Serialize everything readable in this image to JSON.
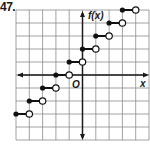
{
  "problem_number": "47.",
  "colors": {
    "grid": "#8c8c8c",
    "axis": "#1a1a1a",
    "step": "#111111",
    "open_fill": "#ffffff"
  },
  "chart_data": {
    "type": "line",
    "subtype": "step_function",
    "title": "",
    "xlabel": "x",
    "ylabel": "f(x)",
    "origin_label": "O",
    "xlim": [
      -5,
      5
    ],
    "ylim": [
      -5,
      5
    ],
    "grid": true,
    "grid_spacing": 1,
    "legend": null,
    "function": "f(x) = [[x]] + 2",
    "segments": [
      {
        "closed_x": -5,
        "open_x": -4,
        "y": -3
      },
      {
        "closed_x": -4,
        "open_x": -3,
        "y": -2
      },
      {
        "closed_x": -3,
        "open_x": -2,
        "y": -1
      },
      {
        "closed_x": -2,
        "open_x": -1,
        "y": 0
      },
      {
        "closed_x": -1,
        "open_x": 0,
        "y": 1
      },
      {
        "closed_x": 0,
        "open_x": 1,
        "y": 2
      },
      {
        "closed_x": 1,
        "open_x": 2,
        "y": 3
      },
      {
        "closed_x": 2,
        "open_x": 3,
        "y": 4
      },
      {
        "closed_x": 3,
        "open_x": 4,
        "y": 5
      }
    ]
  }
}
